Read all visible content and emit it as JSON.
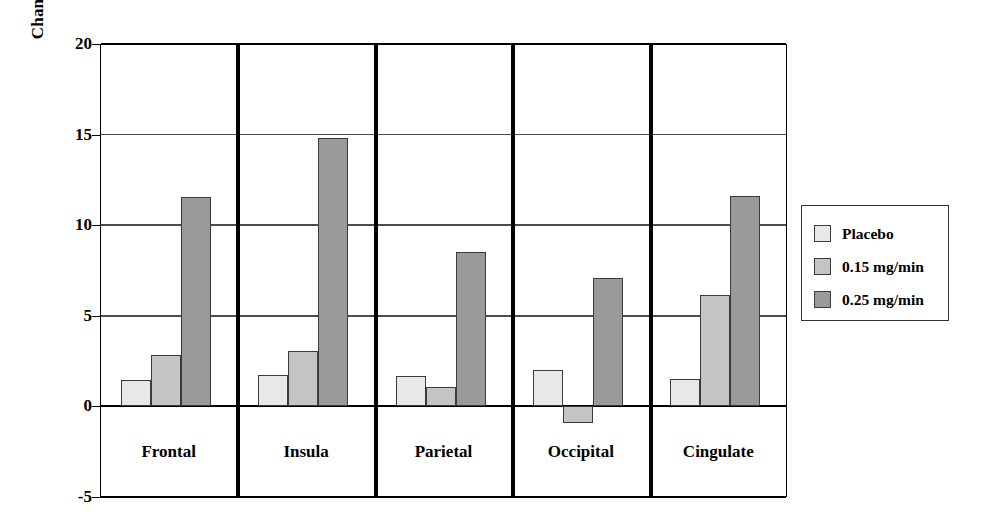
{
  "chart_data": {
    "type": "bar",
    "title": "",
    "xlabel": "",
    "ylabel": "Change from baseline ml/100 gm/min",
    "ylim": [
      -5,
      20
    ],
    "yticks": [
      20,
      15,
      10,
      5,
      0,
      -5
    ],
    "ytick_labels": [
      "20",
      "15",
      "10",
      "5",
      "0",
      "-5"
    ],
    "grid": true,
    "legend_position": "right",
    "categories": [
      "Frontal",
      "Insula",
      "Parietal",
      "Occipital",
      "Cingulate"
    ],
    "series": [
      {
        "name": "Placebo",
        "color": "#e8e8e8",
        "values": [
          1.45,
          1.75,
          1.7,
          2.0,
          1.5
        ]
      },
      {
        "name": "0.15 mg/min",
        "color": "#c4c4c4",
        "values": [
          2.85,
          3.05,
          1.05,
          -0.9,
          6.15
        ]
      },
      {
        "name": "0.25 mg/min",
        "color": "#9a9a9a",
        "values": [
          11.55,
          14.8,
          8.5,
          7.1,
          11.6
        ]
      }
    ]
  },
  "legend": {
    "items": [
      {
        "label": "Placebo"
      },
      {
        "label": "0.15 mg/min"
      },
      {
        "label": "0.25 mg/min"
      }
    ]
  },
  "colors": {
    "axis": "#000000",
    "grid": "#4d4d4d",
    "separator": "#000000",
    "background": "#ffffff",
    "series_placebo": "#e8e8e8",
    "series_015": "#c4c4c4",
    "series_025": "#9a9a9a"
  }
}
